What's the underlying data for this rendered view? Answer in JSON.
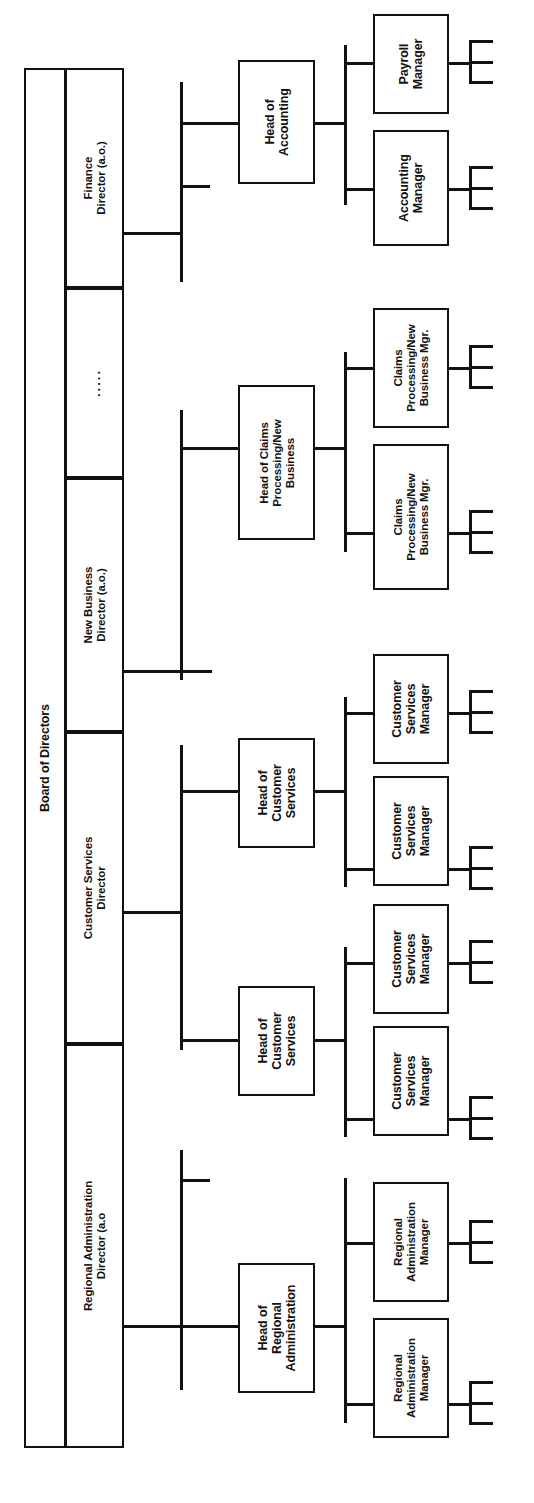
{
  "chart_title": "Board of Directors",
  "root": {
    "label": "Board of Directors"
  },
  "directors": [
    {
      "id": "finance",
      "label": "Finance\nDirector (a.o.)"
    },
    {
      "id": "ellipsis",
      "label": "....."
    },
    {
      "id": "newbiz",
      "label": "New Business\nDirector (a.o.)"
    },
    {
      "id": "custserv",
      "label": "Customer Services\nDirector"
    },
    {
      "id": "regadmin",
      "label": "Regional Administration\nDirector (a.o"
    }
  ],
  "heads": [
    {
      "id": "head-accounting",
      "label": "Head of\nAccounting"
    },
    {
      "id": "head-claims",
      "label": "Head of Claims\nProcessing/New\nBusiness"
    },
    {
      "id": "head-cs-1",
      "label": "Head of\nCustomer\nServices"
    },
    {
      "id": "head-cs-2",
      "label": "Head of\nCustomer\nServices"
    },
    {
      "id": "head-regadmin",
      "label": "Head of\nRegional\nAdministration"
    }
  ],
  "managers": [
    {
      "id": "mgr-payroll",
      "label": "Payroll\nManager"
    },
    {
      "id": "mgr-accounting",
      "label": "Accounting\nManager"
    },
    {
      "id": "mgr-claims-1",
      "label": "Claims\nProcessing/New\nBusiness Mgr."
    },
    {
      "id": "mgr-claims-2",
      "label": "Claims\nProcessing/New\nBusiness Mgr."
    },
    {
      "id": "mgr-cs-1",
      "label": "Customer\nServices\nManager"
    },
    {
      "id": "mgr-cs-2",
      "label": "Customer\nServices\nManager"
    },
    {
      "id": "mgr-cs-3",
      "label": "Customer\nServices\nManager"
    },
    {
      "id": "mgr-cs-4",
      "label": "Customer\nServices\nManager"
    },
    {
      "id": "mgr-regadmin-1",
      "label": "Regional\nAdministration\nManager"
    },
    {
      "id": "mgr-regadmin-2",
      "label": "Regional\nAdministration\nManager"
    }
  ],
  "colors": {
    "line": "#111111",
    "box_fill": "#ffffff",
    "background": "#ffffff"
  }
}
